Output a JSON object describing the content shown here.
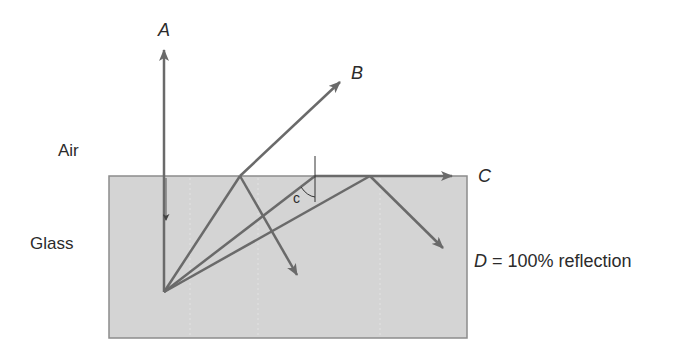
{
  "diagram": {
    "colors": {
      "background": "#ffffff",
      "glass_fill": "#d4d4d4",
      "glass_border": "#8c8c8c",
      "ray": "#6a6a6a",
      "text": "#2b2b2b"
    },
    "media": {
      "air": {
        "label": "Air"
      },
      "glass": {
        "label": "Glass"
      }
    },
    "rays": {
      "A": {
        "label": "A",
        "description": "Normal incidence — passes straight through"
      },
      "B": {
        "label": "B",
        "description": "Refracted ray with partial reflection"
      },
      "C": {
        "label": "C",
        "description": "At critical angle — grazes the surface"
      },
      "D": {
        "label": "D",
        "suffix": " = 100% reflection",
        "description": "Beyond critical angle — total internal reflection"
      }
    },
    "angle": {
      "label": "c",
      "description": "Critical angle"
    }
  }
}
